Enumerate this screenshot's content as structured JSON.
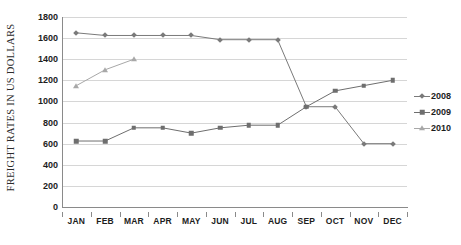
{
  "chart_data": {
    "type": "line",
    "title": "",
    "xlabel": "",
    "ylabel": "FREIGHT RATES IN US DOLLARS",
    "categories": [
      "JAN",
      "FEB",
      "MAR",
      "APR",
      "MAY",
      "JUN",
      "JUL",
      "AUG",
      "SEP",
      "OCT",
      "NOV",
      "DEC"
    ],
    "ylim": [
      0,
      1800
    ],
    "ytick_labels": [
      "0",
      "200",
      "400",
      "600",
      "800",
      "1000",
      "1200",
      "1400",
      "1600",
      "1800"
    ],
    "ytick_values": [
      0,
      200,
      400,
      600,
      800,
      1000,
      1200,
      1400,
      1600,
      1800
    ],
    "grid": true,
    "legend_position": "right",
    "series": [
      {
        "name": "2008",
        "marker": "diamond",
        "color": "#7a7a7a",
        "values": [
          1650,
          1625,
          1625,
          1625,
          1625,
          1585,
          1585,
          1585,
          950,
          950,
          600,
          600
        ]
      },
      {
        "name": "2009",
        "marker": "square",
        "color": "#6e6e6e",
        "values": [
          625,
          625,
          750,
          750,
          700,
          750,
          775,
          775,
          950,
          1100,
          1150,
          1200
        ]
      },
      {
        "name": "2010",
        "marker": "triangle",
        "color": "#a8a8a8",
        "values": [
          1150,
          1300,
          1400,
          null,
          null,
          null,
          null,
          null,
          null,
          null,
          null,
          null
        ]
      }
    ]
  },
  "legend": {
    "items": [
      {
        "label": "2008"
      },
      {
        "label": "2009"
      },
      {
        "label": "2010"
      }
    ]
  }
}
